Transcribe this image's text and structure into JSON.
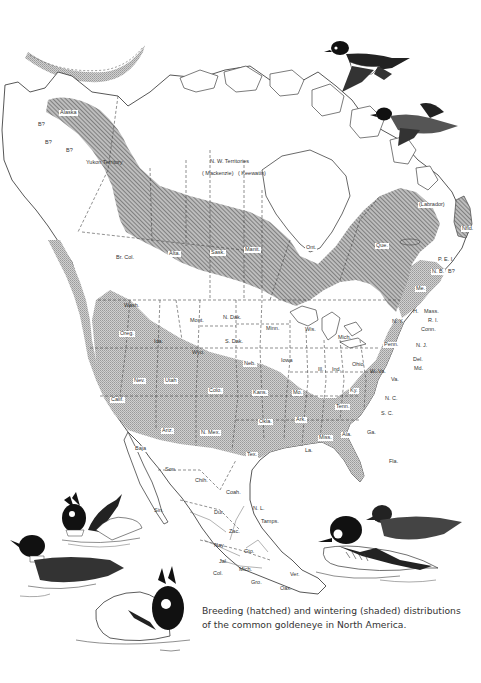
{
  "figure": {
    "caption": "Breeding (hatched) and wintering (shaded) distributions of the common goldeneye in North America.",
    "legend": {
      "breeding": {
        "label": "Breeding",
        "pattern": "hatched"
      },
      "wintering": {
        "label": "Wintering",
        "pattern": "shaded"
      }
    },
    "colors": {
      "background": "#ffffff",
      "outline": "#444444",
      "hatch_fill": "#8c8c8c",
      "shade_fill": "#c4c4c4"
    }
  },
  "map": {
    "region_labels": {
      "alaska": "Alaska",
      "yukon": "Yukon Territory",
      "nwt": "N. W. Territories",
      "mackenzie": "( Mackenzie)",
      "keewatin": "( Keewatin)",
      "labrador": "(Labrador)",
      "br_col": "Br. Col.",
      "alta": "Alta.",
      "sask": "Sask.",
      "manit": "Manit.",
      "ont": "Ont.",
      "que": "Que.",
      "nfld": "Nfld.",
      "pei": "P. E. I.",
      "nb": "N. B.",
      "ns_q": "B?",
      "me": "Me.",
      "nh": "H.",
      "mass": "Mass.",
      "ri": "R. I.",
      "conn": "Conn.",
      "ny": "N. Y.",
      "nj": "N. J.",
      "del": "Del.",
      "md": "Md.",
      "penn": "Penn.",
      "wash": "Wash.",
      "oreg": "Oreg.",
      "ida": "Ida.",
      "mont": "Mont.",
      "wyo": "Wyo.",
      "nev": "Nev.",
      "utah": "Utah",
      "colo": "Colo.",
      "calif": "Calif.",
      "ariz": "Ariz.",
      "nmex": "N. Mex.",
      "ndak": "N. Dak.",
      "sdak": "S. Dak.",
      "neb": "Neb.",
      "kans": "Kans.",
      "okla": "Okla.",
      "tex": "Tex.",
      "minn": "Minn.",
      "iowa": "Iowa",
      "mo": "Mo.",
      "ark": "Ark.",
      "la": "La.",
      "wis": "Wis.",
      "ill": "Ill.",
      "mich": "Mich.",
      "ind": "Ind.",
      "ohio": "Ohio",
      "ky": "Ky.",
      "tenn": "Tenn.",
      "miss": "Miss.",
      "ala": "Ala.",
      "ga": "Ga.",
      "fla": "Fla.",
      "wva": "W. Va.",
      "va": "Va.",
      "nc": "N. C.",
      "sc": "S. C.",
      "baja": "Baja",
      "son": "Son.",
      "chih": "Chih.",
      "coah": "Coah.",
      "nl": "N. L.",
      "sin": "Sin.",
      "dur": "Dur.",
      "zac": "Zac.",
      "tamps": "Tamps.",
      "nay": "Nay.",
      "jal": "Jal.",
      "gto": "Gto.",
      "mich_mx": "Mich.",
      "col": "Col.",
      "gro": "Gro.",
      "oax": "Oax.",
      "ver": "Ver.",
      "q1": "B?",
      "q2": "B?",
      "q3": "B?"
    }
  },
  "illustrations": [
    {
      "name": "goldeneye-flying-male",
      "description": "flying drake goldeneye"
    },
    {
      "name": "goldeneye-flying-female",
      "description": "flying hen goldeneye"
    },
    {
      "name": "goldeneye-courtship-pair",
      "description": "displaying drakes on water"
    },
    {
      "name": "goldeneye-hen-swimming",
      "description": "swimming hen goldeneye"
    },
    {
      "name": "goldeneye-drake-display",
      "description": "drake in head-throw display"
    },
    {
      "name": "goldeneye-swimming-pair",
      "description": "drake and hen swimming"
    }
  ]
}
